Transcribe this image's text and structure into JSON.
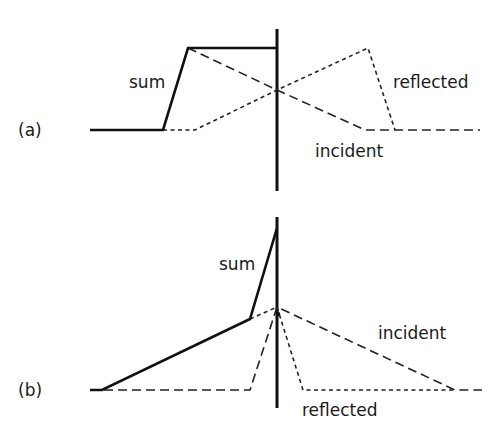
{
  "diagram": {
    "panels": [
      {
        "id": "a",
        "label": "(a)",
        "curves": {
          "sum": {
            "label": "sum",
            "style": "solid"
          },
          "incident": {
            "label": "incident",
            "style": "long-dashed"
          },
          "reflected": {
            "label": "reflected",
            "style": "short-dashed"
          }
        },
        "wall": "vertical boundary"
      },
      {
        "id": "b",
        "label": "(b)",
        "curves": {
          "sum": {
            "label": "sum",
            "style": "solid"
          },
          "incident": {
            "label": "incident",
            "style": "long-dashed"
          },
          "reflected": {
            "label": "reflected",
            "style": "short-dashed"
          }
        },
        "wall": "vertical boundary"
      }
    ]
  }
}
